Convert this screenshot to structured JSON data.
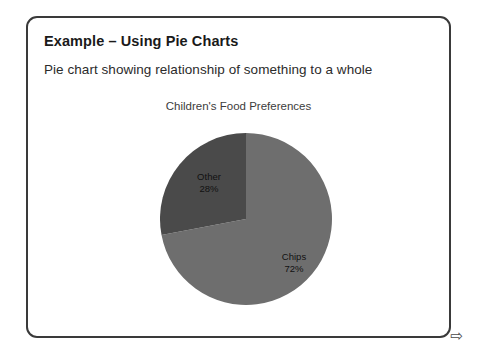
{
  "slide": {
    "title": "Example – Using Pie Charts",
    "subtitle": "Pie chart showing relationship of something to a whole",
    "next_arrow_glyph": "⇨",
    "frame_border_color": "#3a3a3a"
  },
  "chart_data": {
    "type": "pie",
    "title": "Children's Food Preferences",
    "xlabel": "",
    "ylabel": "",
    "legend": "none",
    "labels_inside_slices": true,
    "start_angle_deg": 0,
    "direction": "clockwise",
    "categories": [
      "Chips",
      "Other"
    ],
    "values": [
      72,
      28
    ],
    "value_unit": "percent",
    "slices": [
      {
        "name": "Chips",
        "value": 72,
        "value_label": "72%",
        "color": "#6e6e6e",
        "start_angle_deg": 0,
        "end_angle_deg": 259.2
      },
      {
        "name": "Other",
        "value": 28,
        "value_label": "28%",
        "color": "#4a4a4a",
        "start_angle_deg": 259.2,
        "end_angle_deg": 360
      }
    ]
  }
}
